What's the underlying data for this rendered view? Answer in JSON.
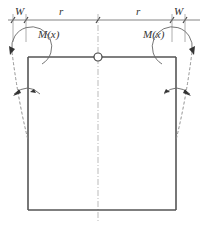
{
  "diagram": {
    "labels": {
      "w_left": "W",
      "r_left": "r",
      "r_right": "r",
      "w_right": "W",
      "moment_left": "M(x)",
      "moment_right": "M(x)"
    },
    "colors": {
      "line": "#555555",
      "dimension": "#777777",
      "dashed": "#888888",
      "background": "#ffffff"
    }
  }
}
